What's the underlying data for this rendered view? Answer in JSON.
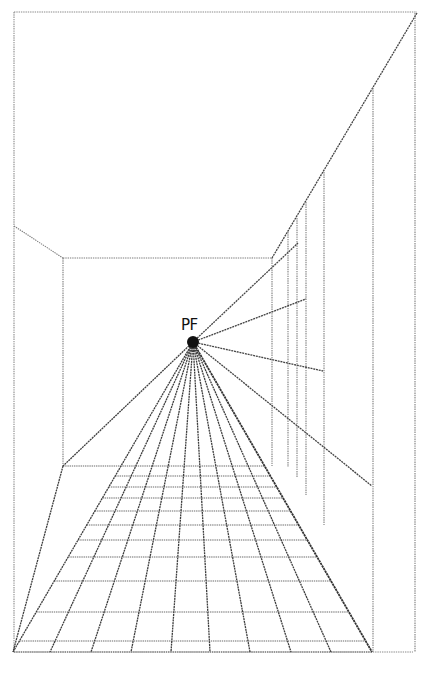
{
  "figure": {
    "title_cutoff": "",
    "pf_label": "PF",
    "colors": {
      "background": "#ffffff",
      "lines": "#444444",
      "frame": "#8a8a8a",
      "dot": "#111111"
    },
    "vanishing_point": {
      "x": 193,
      "y": 342,
      "r": 6
    },
    "frame": {
      "left": 14,
      "top": 12,
      "right": 417,
      "bottom": 652
    },
    "back_wall": {
      "left": 63,
      "top": 258,
      "right": 272,
      "bottom": 466
    },
    "left_ceiling_edge": {
      "x1": 14,
      "y1": 226,
      "x2": 63,
      "y2": 258
    },
    "right_ceiling_edge": {
      "x1": 417,
      "y1": 13,
      "x2": 272,
      "y2": 258
    },
    "right_wall_verticals": [
      {
        "x": 288,
        "y1": 232,
        "y2": 467
      },
      {
        "x": 297,
        "y1": 218,
        "y2": 478
      },
      {
        "x": 306,
        "y1": 202,
        "y2": 495
      },
      {
        "x": 324,
        "y1": 172,
        "y2": 525
      },
      {
        "x": 373,
        "y1": 88,
        "y2": 652
      },
      {
        "x": 415,
        "y1": 13,
        "y2": 652
      }
    ],
    "right_wall_rays": [
      {
        "x": 298,
        "y": 243
      },
      {
        "x": 306,
        "y": 299
      },
      {
        "x": 323,
        "y": 371
      },
      {
        "x": 372,
        "y": 486
      }
    ],
    "floor_bottom_points": [
      13,
      50,
      91,
      131,
      171,
      210,
      250,
      291,
      331,
      372
    ],
    "floor_horizontals": [
      466,
      476,
      487,
      498,
      511,
      525,
      540,
      557,
      581,
      612,
      641,
      652
    ]
  }
}
